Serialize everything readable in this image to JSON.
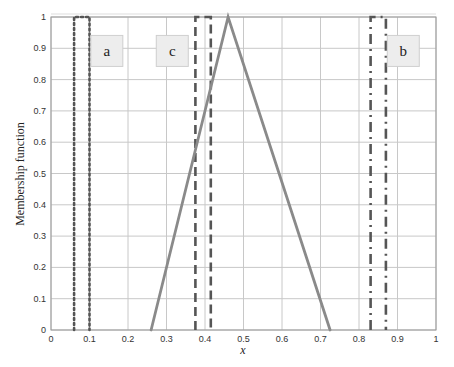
{
  "chart_data": {
    "type": "line",
    "title": "",
    "xlabel": "x",
    "ylabel": "Membership function",
    "xlim": [
      0,
      1
    ],
    "ylim": [
      0,
      1
    ],
    "grid": true,
    "legend_position": "none",
    "x_ticks": [
      "0",
      "0.1",
      "0.2",
      "0.3",
      "0.4",
      "0.5",
      "0.6",
      "0.7",
      "0.8",
      "0.9",
      "1"
    ],
    "y_ticks": [
      "0",
      "0.1",
      "0.2",
      "0.3",
      "0.4",
      "0.5",
      "0.6",
      "0.7",
      "0.8",
      "0.9",
      "1"
    ],
    "series": [
      {
        "name": "a",
        "style": "dotted",
        "color": "#555555",
        "x": [
          0.06,
          0.06,
          0.1,
          0.1
        ],
        "y": [
          0,
          1,
          1,
          0
        ]
      },
      {
        "name": "c",
        "style": "dashed",
        "color": "#555555",
        "x": [
          0.375,
          0.375,
          0.415,
          0.415
        ],
        "y": [
          0,
          1,
          1,
          0
        ]
      },
      {
        "name": "b",
        "style": "dash-dot",
        "color": "#555555",
        "x": [
          0.83,
          0.83,
          0.87,
          0.87
        ],
        "y": [
          0,
          1,
          1,
          0
        ]
      },
      {
        "name": "triangle",
        "style": "solid",
        "color": "#8a8a8a",
        "x": [
          0.26,
          0.46,
          0.725
        ],
        "y": [
          0,
          1,
          0
        ]
      }
    ],
    "annotations": [
      {
        "text": "a",
        "x": 0.145,
        "y": 0.89
      },
      {
        "text": "c",
        "x": 0.315,
        "y": 0.89
      },
      {
        "text": "b",
        "x": 0.915,
        "y": 0.89
      }
    ]
  }
}
